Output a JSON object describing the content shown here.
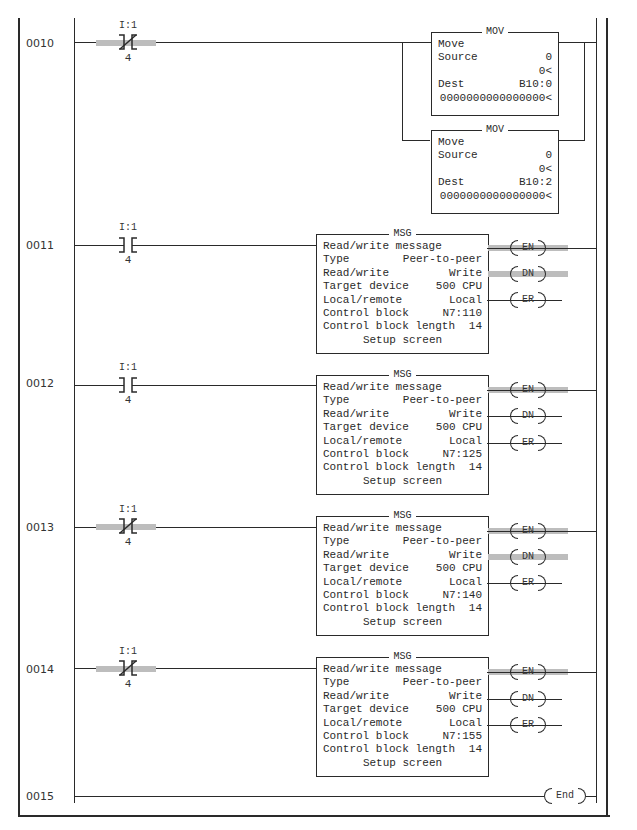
{
  "rails": {
    "outer_border": true
  },
  "rungs": [
    {
      "number": "0010",
      "contact": {
        "address": "I:1",
        "bit": "4",
        "type": "XIO",
        "energized": true
      },
      "instructions": [
        {
          "type": "MOV",
          "title": "MOV",
          "label": "Move",
          "source_label": "Source",
          "source": "0",
          "source_value": "0<",
          "dest_label": "Dest",
          "dest": "B10:0",
          "dest_value": "0000000000000000<"
        },
        {
          "type": "MOV",
          "title": "MOV",
          "label": "Move",
          "source_label": "Source",
          "source": "0",
          "source_value": "0<",
          "dest_label": "Dest",
          "dest": "B10:2",
          "dest_value": "0000000000000000<"
        }
      ]
    },
    {
      "number": "0011",
      "contact": {
        "address": "I:1",
        "bit": "4",
        "type": "XIC",
        "energized": false
      },
      "msg": {
        "title": "MSG",
        "header": "Read/write message",
        "type_label": "Type",
        "type": "Peer-to-peer",
        "rw_label": "Read/write",
        "rw": "Write",
        "target_label": "Target device",
        "target": "500 CPU",
        "lr_label": "Local/remote",
        "lr": "Local",
        "cb_label": "Control block",
        "cb": "N7:110",
        "cbl_label": "Control block length",
        "cbl": "14",
        "setup": "Setup screen"
      },
      "coils": [
        {
          "label": "EN",
          "energized": true
        },
        {
          "label": "DN",
          "energized": true
        },
        {
          "label": "ER",
          "energized": false
        }
      ]
    },
    {
      "number": "0012",
      "contact": {
        "address": "I:1",
        "bit": "4",
        "type": "XIC",
        "energized": false
      },
      "msg": {
        "title": "MSG",
        "header": "Read/write message",
        "type_label": "Type",
        "type": "Peer-to-peer",
        "rw_label": "Read/write",
        "rw": "Write",
        "target_label": "Target device",
        "target": "500 CPU",
        "lr_label": "Local/remote",
        "lr": "Local",
        "cb_label": "Control block",
        "cb": "N7:125",
        "cbl_label": "Control block length",
        "cbl": "14",
        "setup": "Setup screen"
      },
      "coils": [
        {
          "label": "EN",
          "energized": true
        },
        {
          "label": "DN",
          "energized": false
        },
        {
          "label": "ER",
          "energized": false
        }
      ]
    },
    {
      "number": "0013",
      "contact": {
        "address": "I:1",
        "bit": "4",
        "type": "XIO",
        "energized": true
      },
      "msg": {
        "title": "MSG",
        "header": "Read/write message",
        "type_label": "Type",
        "type": "Peer-to-peer",
        "rw_label": "Read/write",
        "rw": "Write",
        "target_label": "Target device",
        "target": "500 CPU",
        "lr_label": "Local/remote",
        "lr": "Local",
        "cb_label": "Control block",
        "cb": "N7:140",
        "cbl_label": "Control block length",
        "cbl": "14",
        "setup": "Setup screen"
      },
      "coils": [
        {
          "label": "EN",
          "energized": true
        },
        {
          "label": "DN",
          "energized": true
        },
        {
          "label": "ER",
          "energized": false
        }
      ]
    },
    {
      "number": "0014",
      "contact": {
        "address": "I:1",
        "bit": "4",
        "type": "XIO",
        "energized": true
      },
      "msg": {
        "title": "MSG",
        "header": "Read/write message",
        "type_label": "Type",
        "type": "Peer-to-peer",
        "rw_label": "Read/write",
        "rw": "Write",
        "target_label": "Target device",
        "target": "500 CPU",
        "lr_label": "Local/remote",
        "lr": "Local",
        "cb_label": "Control block",
        "cb": "N7:155",
        "cbl_label": "Control block length",
        "cbl": "14",
        "setup": "Setup screen"
      },
      "coils": [
        {
          "label": "EN",
          "energized": true
        },
        {
          "label": "DN",
          "energized": false
        },
        {
          "label": "ER",
          "energized": false
        }
      ]
    },
    {
      "number": "0015",
      "end_label": "End"
    }
  ],
  "colors": {
    "line": "#2a2a2a",
    "energized_highlight": "#bdbdbd",
    "background": "#ffffff"
  }
}
